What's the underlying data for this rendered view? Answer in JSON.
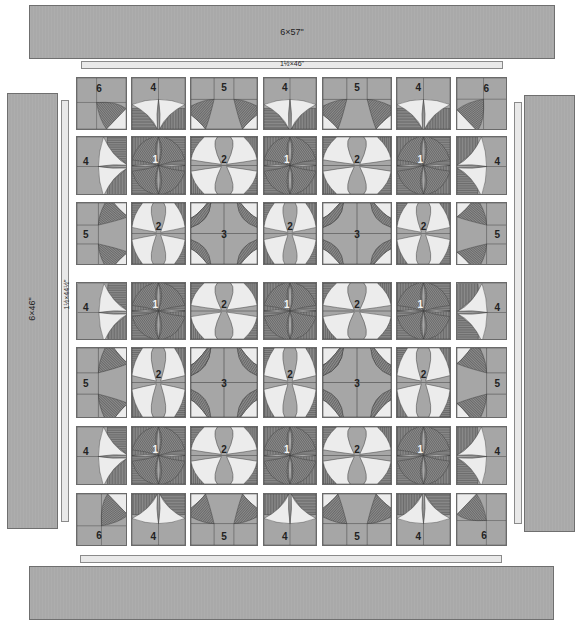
{
  "diagram": {
    "borders": {
      "outer_top": {
        "label": "6×57\""
      },
      "outer_bottom": {
        "label": ""
      },
      "outer_left": {
        "label": "6×46\""
      },
      "outer_right": {
        "label": ""
      },
      "inner_top": {
        "label": "1½×46\""
      },
      "inner_left": {
        "label": "1½×44½\""
      },
      "inner_bottom": {
        "label": ""
      },
      "inner_right": {
        "label": ""
      }
    },
    "grid": {
      "rows": 7,
      "cols": 7,
      "block_labels": [
        [
          "6",
          "4",
          "5",
          "4",
          "5",
          "4",
          "6"
        ],
        [
          "4",
          "1",
          "2",
          "1",
          "2",
          "1",
          "4"
        ],
        [
          "5",
          "2",
          "3",
          "2",
          "3",
          "2",
          "5"
        ],
        [
          "4",
          "1",
          "2",
          "1",
          "2",
          "1",
          "4"
        ],
        [
          "5",
          "2",
          "3",
          "2",
          "3",
          "2",
          "5"
        ],
        [
          "4",
          "1",
          "2",
          "1",
          "2",
          "1",
          "4"
        ],
        [
          "6",
          "4",
          "5",
          "4",
          "5",
          "4",
          "6"
        ]
      ]
    },
    "colors": {
      "background": "#a6a6a6",
      "light_fabric": "#ececec",
      "dark_stripe": "#6e6e6e",
      "medium": "#a6a6a6",
      "border": "#a9a9a9",
      "strip": "#e9e9e9",
      "outline": "#3c3c3c"
    }
  }
}
